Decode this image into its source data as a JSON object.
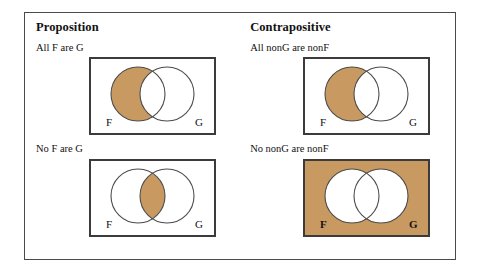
{
  "figure": {
    "columns": [
      {
        "id": "proposition",
        "heading": "Proposition",
        "cases": [
          {
            "id": "all-f-are-g",
            "label": "All F are G",
            "diagram": {
              "left_circle_label": "F",
              "right_circle_label": "G",
              "background_shaded": false,
              "shaded_regions": [
                "F-only"
              ],
              "unshaded_regions": [
                "F-and-G",
                "G-only",
                "outside"
              ]
            }
          },
          {
            "id": "no-f-are-g",
            "label": "No F are G",
            "diagram": {
              "left_circle_label": "F",
              "right_circle_label": "G",
              "background_shaded": false,
              "shaded_regions": [
                "F-and-G"
              ],
              "unshaded_regions": [
                "F-only",
                "G-only",
                "outside"
              ]
            }
          }
        ]
      },
      {
        "id": "contrapositive",
        "heading": "Contrapositive",
        "cases": [
          {
            "id": "all-nong-are-nonf",
            "label": "All nonG are nonF",
            "diagram": {
              "left_circle_label": "F",
              "right_circle_label": "G",
              "background_shaded": false,
              "shaded_regions": [
                "F-only"
              ],
              "unshaded_regions": [
                "F-and-G",
                "G-only",
                "outside"
              ]
            }
          },
          {
            "id": "no-nong-are-nonf",
            "label": "No nonG are nonF",
            "diagram": {
              "left_circle_label": "F",
              "right_circle_label": "G",
              "background_shaded": true,
              "shaded_regions": [
                "outside"
              ],
              "unshaded_regions": [
                "F-only",
                "F-and-G",
                "G-only"
              ]
            }
          }
        ]
      }
    ]
  },
  "colors": {
    "shade_fill": "#c89a62",
    "unshaded_fill": "#ffffff",
    "circle_stroke": "#4b4b4b",
    "box_stroke": "#3b3b3b",
    "frame_stroke": "#4a4a4a",
    "text": "#111111",
    "page_background": "#ffffff"
  }
}
